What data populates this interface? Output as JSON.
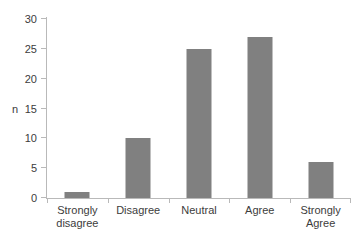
{
  "chart_data": {
    "type": "bar",
    "title": "",
    "subtitle": "",
    "xlabel": "",
    "ylabel": "n",
    "categories": [
      "Strongly disagree",
      "Disagree",
      "Neutral",
      "Agree",
      "Strongly Agree"
    ],
    "category_lines": [
      [
        "Strongly",
        "disagree"
      ],
      [
        "Disagree",
        ""
      ],
      [
        "Neutral",
        ""
      ],
      [
        "Agree",
        ""
      ],
      [
        "Strongly",
        "Agree"
      ]
    ],
    "values": [
      1,
      10,
      25,
      27,
      6
    ],
    "ylim": [
      0,
      30
    ],
    "yticks": [
      30,
      25,
      20,
      15,
      10,
      5,
      0
    ],
    "ytick_labels": [
      "30",
      "25",
      "20",
      "15",
      "10",
      "5",
      "0"
    ],
    "grid": false,
    "legend": false,
    "legend_position": "none",
    "bar_color": "#808080",
    "axis_color": "#b9b9b9",
    "text_color": "#3c3c3c",
    "background": "#ffffff"
  }
}
